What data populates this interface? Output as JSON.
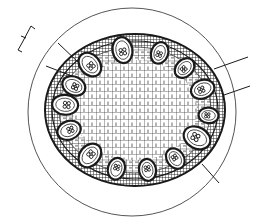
{
  "figure": {
    "colors": {
      "background": "#ffffff",
      "ink": "#1a1a1a",
      "outline": "#555555",
      "cell_fill": "#ffffff"
    },
    "outer_circle": {
      "cx": 132,
      "cy": 112,
      "r": 104
    },
    "stem": {
      "cx": 135,
      "cy": 110,
      "rx": 90,
      "ry": 76
    },
    "pith_ring": {
      "rx": 62,
      "ry": 50
    },
    "vascular_bundles": [
      {
        "angle": -100,
        "dist": 0.8,
        "size": 11
      },
      {
        "angle": -130,
        "dist": 0.78,
        "size": 11
      },
      {
        "angle": -155,
        "dist": 0.75,
        "size": 10
      },
      {
        "angle": -70,
        "dist": 0.8,
        "size": 9
      },
      {
        "angle": -45,
        "dist": 0.78,
        "size": 9
      },
      {
        "angle": -20,
        "dist": 0.8,
        "size": 10
      },
      {
        "angle": 5,
        "dist": 0.82,
        "size": 8
      },
      {
        "angle": 28,
        "dist": 0.78,
        "size": 12
      },
      {
        "angle": 55,
        "dist": 0.78,
        "size": 9
      },
      {
        "angle": 80,
        "dist": 0.8,
        "size": 9
      },
      {
        "angle": 105,
        "dist": 0.8,
        "size": 9
      },
      {
        "angle": 130,
        "dist": 0.78,
        "size": 11
      },
      {
        "angle": 160,
        "dist": 0.78,
        "size": 10
      },
      {
        "angle": 185,
        "dist": 0.78,
        "size": 11
      }
    ],
    "leader_lines": [
      {
        "name": "leader-line-1",
        "x1": 58,
        "y1": 43,
        "x2": 80,
        "y2": 64
      },
      {
        "name": "leader-line-2",
        "x1": 46,
        "y1": 66,
        "x2": 72,
        "y2": 76
      },
      {
        "name": "leader-line-3",
        "x1": 248,
        "y1": 57,
        "x2": 214,
        "y2": 69
      },
      {
        "name": "leader-line-4",
        "x1": 250,
        "y1": 86,
        "x2": 224,
        "y2": 95
      },
      {
        "name": "leader-line-5",
        "x1": 219,
        "y1": 183,
        "x2": 202,
        "y2": 164
      }
    ],
    "bracket_symbol": {
      "points": "35,29 31,26 22,43 18,50 22,52",
      "tick": {
        "x1": 21,
        "y1": 36,
        "x2": 26,
        "y2": 38
      }
    }
  }
}
